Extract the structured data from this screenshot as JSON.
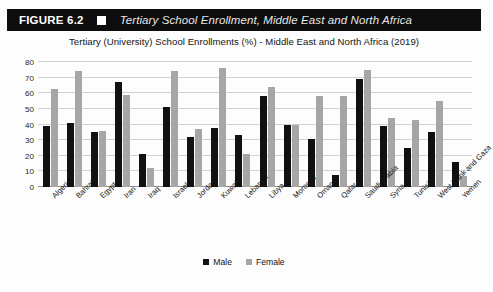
{
  "figure": {
    "number_label": "FIGURE 6.2",
    "marker_icon": "white-square-icon",
    "title": "Tertiary School Enrollment, Middle East and North Africa"
  },
  "chart_data": {
    "type": "bar",
    "title": "Tertiary (University) School Enrollments (%) - Middle East and North Africa (2019)",
    "xlabel": "",
    "ylabel": "",
    "ylim": [
      0,
      80
    ],
    "ytick_step": 10,
    "yticks": [
      "0",
      "10",
      "20",
      "30",
      "40",
      "50",
      "60",
      "70",
      "80"
    ],
    "grid": true,
    "legend_position": "bottom",
    "categories": [
      "Algeria",
      "Bahrain",
      "Egypt",
      "Iran",
      "Iraq",
      "Israel",
      "Jordan",
      "Kuwait",
      "Lebanon",
      "Libya",
      "Morocco",
      "Oman",
      "Qatar",
      "Saudi Arabia",
      "Syria",
      "Tunisia",
      "West Bank and Gaza",
      "Yemen"
    ],
    "series": [
      {
        "name": "Male",
        "color": "#111111",
        "values": [
          39,
          41,
          35,
          67,
          21,
          51,
          32,
          38,
          33,
          58,
          40,
          31,
          8,
          69,
          39,
          25,
          35,
          16
        ]
      },
      {
        "name": "Female",
        "color": "#a6a6a6",
        "values": [
          63,
          74,
          36,
          59,
          12,
          74,
          37,
          76,
          21,
          64,
          40,
          58,
          58,
          75,
          44,
          43,
          55,
          7
        ]
      }
    ]
  }
}
